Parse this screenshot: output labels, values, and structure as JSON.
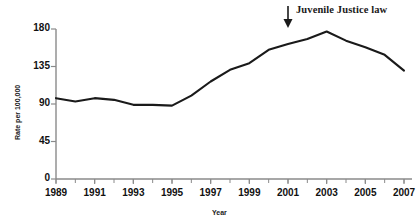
{
  "chart_data": {
    "type": "line",
    "title": "",
    "xlabel": "Year",
    "ylabel": "Rate per 100,000",
    "xlim": [
      1989,
      2007
    ],
    "ylim": [
      0,
      180
    ],
    "ytick_labels": [
      "0",
      "45",
      "90",
      "135",
      "180"
    ],
    "yticks": [
      0,
      45,
      90,
      135,
      180
    ],
    "xtick_labels": [
      "1989",
      "1991",
      "1993",
      "1995",
      "1997",
      "1999",
      "2001",
      "2003",
      "2005",
      "2007"
    ],
    "xticks": [
      1989,
      1991,
      1993,
      1995,
      1997,
      1999,
      2001,
      2003,
      2005,
      2007
    ],
    "minor_xticks_every": 1,
    "grid": false,
    "legend": "none",
    "line_color": "#1a1a1a",
    "x": [
      1989,
      1990,
      1991,
      1992,
      1993,
      1994,
      1995,
      1996,
      1997,
      1998,
      1999,
      2000,
      2001,
      2002,
      2003,
      2004,
      2005,
      2006,
      2007
    ],
    "values": [
      97,
      93,
      97,
      95,
      89,
      89,
      88,
      100,
      117,
      131,
      139,
      155,
      162,
      168,
      177,
      166,
      158,
      149,
      130
    ],
    "series": [
      {
        "name": "Rate per 100,000",
        "values": [
          97,
          93,
          97,
          95,
          89,
          89,
          88,
          100,
          117,
          131,
          139,
          155,
          162,
          168,
          177,
          166,
          158,
          149,
          130
        ]
      }
    ],
    "annotations": [
      {
        "text": "Juvenile Justice law",
        "x": 2001,
        "marker": "down-arrow"
      }
    ]
  },
  "figure": {
    "annotation_label": "Juvenile Justice law",
    "axis_x_title": "Year",
    "axis_y_title": "Rate per 100,000"
  }
}
